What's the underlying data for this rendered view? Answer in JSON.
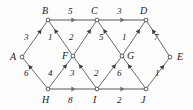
{
  "diagram": {
    "type": "directed-weighted-graph",
    "background_color": "#fdfdfd",
    "edge_color": "#5a5a5a",
    "horizontal_edge_color": "#8f8f8f",
    "node_fill": "#ffffff",
    "node_stroke": "#4a4a4a",
    "text_color": "#1a1a1a",
    "nodes": [
      {
        "id": "A",
        "label": "A",
        "x": 22,
        "y": 57,
        "label_x": 10,
        "label_y": 52
      },
      {
        "id": "B",
        "label": "B",
        "x": 48,
        "y": 20,
        "label_x": 42,
        "label_y": 6
      },
      {
        "id": "C",
        "label": "C",
        "x": 97,
        "y": 20,
        "label_x": 91,
        "label_y": 6
      },
      {
        "id": "D",
        "label": "D",
        "x": 146,
        "y": 20,
        "label_x": 140,
        "label_y": 6
      },
      {
        "id": "E",
        "label": "E",
        "x": 170,
        "y": 57,
        "label_x": 177,
        "label_y": 52
      },
      {
        "id": "F",
        "label": "F",
        "x": 73,
        "y": 56,
        "label_x": 62,
        "label_y": 51
      },
      {
        "id": "G",
        "label": "G",
        "x": 122,
        "y": 56,
        "label_x": 127,
        "label_y": 51
      },
      {
        "id": "H",
        "label": "H",
        "x": 48,
        "y": 89,
        "label_x": 42,
        "label_y": 95
      },
      {
        "id": "I",
        "label": "I",
        "x": 97,
        "y": 89,
        "label_x": 93,
        "label_y": 95
      },
      {
        "id": "J",
        "label": "J",
        "x": 146,
        "y": 89,
        "label_x": 141,
        "label_y": 95
      }
    ],
    "edges": [
      {
        "from": "B",
        "to": "C",
        "weight": "5",
        "label_x": 68,
        "label_y": 7,
        "style": "horizontal"
      },
      {
        "from": "C",
        "to": "D",
        "weight": "3",
        "label_x": 117,
        "label_y": 7,
        "style": "horizontal"
      },
      {
        "from": "H",
        "to": "I",
        "weight": "8",
        "label_x": 68,
        "label_y": 96,
        "style": "horizontal"
      },
      {
        "from": "I",
        "to": "J",
        "weight": "2",
        "label_x": 117,
        "label_y": 96,
        "style": "horizontal"
      },
      {
        "from": "A",
        "to": "B",
        "weight": "3",
        "label_x": 24,
        "label_y": 33,
        "style": "diagonal"
      },
      {
        "from": "F",
        "to": "B",
        "weight": "1",
        "label_x": 48,
        "label_y": 33,
        "style": "diagonal"
      },
      {
        "from": "F",
        "to": "C",
        "weight": "2",
        "label_x": 69,
        "label_y": 33,
        "style": "diagonal"
      },
      {
        "from": "G",
        "to": "C",
        "weight": "5",
        "label_x": 99,
        "label_y": 33,
        "style": "diagonal"
      },
      {
        "from": "G",
        "to": "D",
        "weight": "1",
        "label_x": 122,
        "label_y": 33,
        "style": "diagonal"
      },
      {
        "from": "E",
        "to": "D",
        "weight": "7",
        "label_x": 154,
        "label_y": 33,
        "style": "diagonal"
      },
      {
        "from": "H",
        "to": "A",
        "weight": "6",
        "label_x": 24,
        "label_y": 69,
        "style": "diagonal"
      },
      {
        "from": "H",
        "to": "F",
        "weight": "4",
        "label_x": 48,
        "label_y": 69,
        "style": "diagonal"
      },
      {
        "from": "I",
        "to": "F",
        "weight": "3",
        "label_x": 70,
        "label_y": 69,
        "style": "diagonal"
      },
      {
        "from": "I",
        "to": "G",
        "weight": "2",
        "label_x": 94,
        "label_y": 69,
        "style": "diagonal"
      },
      {
        "from": "J",
        "to": "G",
        "weight": "6",
        "label_x": 117,
        "label_y": 69,
        "style": "diagonal"
      },
      {
        "from": "J",
        "to": "E",
        "weight": "1",
        "label_x": 155,
        "label_y": 69,
        "style": "diagonal"
      }
    ]
  }
}
